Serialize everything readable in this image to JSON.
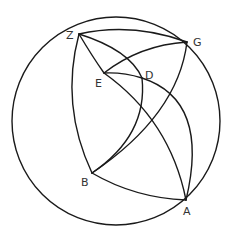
{
  "figure": {
    "type": "spherical-geometry-diagram",
    "stroke_color": "#1a1a1a",
    "label_color": "#333333",
    "outer_circle": {
      "cx": 116,
      "cy": 121,
      "r": 104
    },
    "points": [
      {
        "id": "Z",
        "label": "Z",
        "x": 79,
        "y": 34,
        "lx": 66,
        "ly": 39
      },
      {
        "id": "G",
        "label": "G",
        "x": 187,
        "y": 42,
        "lx": 193,
        "ly": 46
      },
      {
        "id": "E",
        "label": "E",
        "x": 104,
        "y": 73,
        "lx": 95,
        "ly": 87
      },
      {
        "id": "D",
        "label": "D",
        "x": 142,
        "y": 78,
        "lx": 145,
        "ly": 79
      },
      {
        "id": "B",
        "label": "B",
        "x": 92,
        "y": 173,
        "lx": 81,
        "ly": 186
      },
      {
        "id": "A",
        "label": "A",
        "x": 186,
        "y": 200,
        "lx": 183,
        "ly": 215
      }
    ],
    "arcs": [
      {
        "name": "arc-Z-G",
        "from": "Z",
        "to": "G"
      },
      {
        "name": "arc-Z-B",
        "from": "Z",
        "to": "B"
      },
      {
        "name": "arc-Z-D",
        "from": "Z",
        "to": "D"
      },
      {
        "name": "arc-Z-E-A",
        "from": "Z",
        "to": "A",
        "through": "E"
      },
      {
        "name": "arc-E-G",
        "from": "E",
        "to": "G"
      },
      {
        "name": "arc-E-D-A",
        "from": "E",
        "to": "A",
        "through": "D"
      },
      {
        "name": "arc-D-B",
        "from": "D",
        "to": "B"
      },
      {
        "name": "arc-G-B",
        "from": "G",
        "to": "B"
      },
      {
        "name": "arc-G-A",
        "from": "G",
        "to": "A"
      },
      {
        "name": "arc-B-A",
        "from": "B",
        "to": "A"
      }
    ]
  },
  "labels": {
    "Z": "Z",
    "G": "G",
    "E": "E",
    "D": "D",
    "B": "B",
    "A": "A"
  }
}
